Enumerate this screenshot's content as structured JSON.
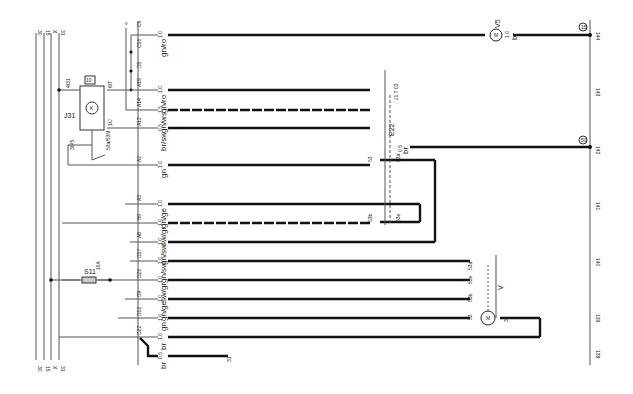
{
  "diagram": {
    "supply_rails": [
      "30",
      "15",
      "X",
      "31"
    ],
    "top_bus_label": "v",
    "connectors": [
      {
        "pin": "C9",
        "size": "1.0",
        "color": "gn/ro"
      },
      {
        "pin": "C10",
        "size": "",
        "color": ""
      },
      {
        "pin": "D5",
        "size": "",
        "color": ""
      },
      {
        "pin": "A19",
        "size": "1.0",
        "color": "gn/ro"
      },
      {
        "pin": "A14",
        "size": "1.5",
        "color": "gn/ws"
      },
      {
        "pin": "A12",
        "size": "0.5",
        "color": "br/sw"
      },
      {
        "pin": "A2",
        "size": "1.0",
        "color": "gn"
      },
      {
        "pin": "A3",
        "size": "1.0",
        "color": "gn/ge"
      },
      {
        "pin": "B9",
        "size": "1.0",
        "color": "sw/gr"
      },
      {
        "pin": "A6",
        "size": "1.0",
        "color": "gn/sw"
      },
      {
        "pin": "D17",
        "size": "1.0",
        "color": "gn/sw"
      },
      {
        "pin": "D20",
        "size": "1.0",
        "color": "sw/gr"
      },
      {
        "pin": "D9",
        "size": "1.0",
        "color": "gn/ge"
      },
      {
        "pin": "D12",
        "size": "1.0",
        "color": "gn"
      },
      {
        "pin": "D22",
        "size": "1.0",
        "color": "br"
      },
      {
        "pin": "",
        "size": "1.5",
        "color": "br"
      }
    ],
    "relay": {
      "name": "J31",
      "number": "10",
      "pins": [
        "4/31",
        "6/T",
        "1/J"
      ],
      "switch_labels": [
        "3/P5",
        "5/53",
        "53a/53M"
      ]
    },
    "fuse": {
      "name": "S11",
      "rating": "15A"
    },
    "switch": {
      "name": "E22",
      "part": "J1 T 03",
      "terminals": [
        "1",
        "1",
        "J",
        "53",
        "53a",
        "53b",
        "53e",
        "31"
      ]
    },
    "wiper_motor": {
      "name": "V",
      "terminals": [
        "53a",
        "53",
        "53b",
        "53e",
        "31"
      ]
    },
    "washer_pump": {
      "name": "V5",
      "wire_size": "1.0",
      "wire_color": "br"
    },
    "ground_wire": {
      "size": "0.5",
      "color": "br",
      "ground_ref": "31"
    },
    "branch_labels": [
      "53",
      "53b",
      "53e",
      "53a"
    ],
    "e22_out": {
      "size": "0.5",
      "color": "br"
    },
    "ground_points": [
      "15",
      "50"
    ],
    "current_track": [
      "144",
      "143",
      "142",
      "141",
      "140",
      "139",
      "138"
    ]
  }
}
